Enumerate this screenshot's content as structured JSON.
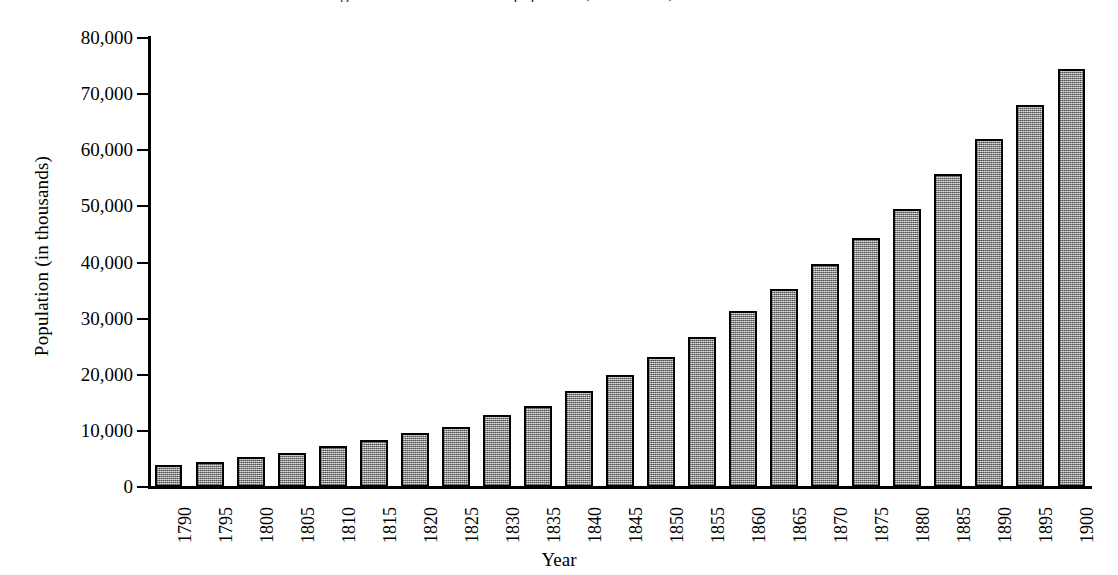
{
  "chart_data": {
    "type": "bar",
    "title": "Figure: Growth of the U.S. population, 1790-1900, from census data",
    "xlabel": "Year",
    "ylabel": "Population (in thousands)",
    "ylim": [
      0,
      80000
    ],
    "ytick_values": [
      0,
      10000,
      20000,
      30000,
      40000,
      50000,
      60000,
      70000,
      80000
    ],
    "ytick_labels": [
      "0",
      "10,000",
      "20,000",
      "30,000",
      "40,000",
      "50,000",
      "60,000",
      "70,000",
      "80,000"
    ],
    "grid": false,
    "legend": null,
    "bar_color": "#9d9d9d",
    "bar_edge_color": "#000000",
    "categories": [
      "1790",
      "1795",
      "1800",
      "1805",
      "1810",
      "1815",
      "1820",
      "1825",
      "1830",
      "1835",
      "1840",
      "1845",
      "1850",
      "1855",
      "1860",
      "1865",
      "1870",
      "1875",
      "1880",
      "1885",
      "1890",
      "1895",
      "1900"
    ],
    "values": [
      3929,
      4500,
      5308,
      6100,
      7240,
      8400,
      9638,
      10700,
      12866,
      14400,
      17069,
      19900,
      23192,
      26700,
      31443,
      35300,
      39818,
      44300,
      49500,
      55800,
      62090,
      68000,
      74500
    ]
  }
}
